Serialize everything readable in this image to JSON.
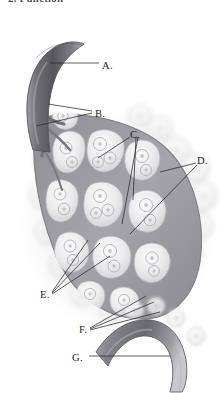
{
  "figure": {
    "title": "2. Function",
    "background_color": "#ffffff",
    "ink_color": "#1d1d1d",
    "width": 223,
    "height": 393,
    "style": "grayscale-pencil-shaded-anatomical-drawing"
  },
  "palette": {
    "duct_dark": "#5d5d60",
    "duct_mid": "#8a8a8e",
    "duct_light": "#b9b9bd",
    "septum": "#9a9a9f",
    "lobule_fill": "#e2e2e4",
    "lobule_inner": "#f2f2f3",
    "cell_outline": "#a9a9ae",
    "halo": "#efeff0",
    "leader_line": "#2a2a2a",
    "text": "#1d1d1d"
  },
  "labels": [
    {
      "id": "A",
      "text": "A.",
      "x": 102,
      "y": 60,
      "leaders": [
        {
          "x1": 99,
          "y1": 63,
          "x2": 50,
          "y2": 63
        }
      ]
    },
    {
      "id": "B",
      "text": "B.",
      "x": 95,
      "y": 108,
      "leaders": [
        {
          "x1": 92,
          "y1": 111,
          "x2": 48,
          "y2": 104
        },
        {
          "x1": 92,
          "y1": 113,
          "x2": 36,
          "y2": 126
        }
      ]
    },
    {
      "id": "C",
      "text": "C.",
      "x": 130,
      "y": 129,
      "leaders": [
        {
          "x1": 130,
          "y1": 137,
          "x2": 98,
          "y2": 158
        },
        {
          "x1": 136,
          "y1": 137,
          "x2": 133,
          "y2": 200
        },
        {
          "x1": 138,
          "y1": 137,
          "x2": 122,
          "y2": 224
        }
      ]
    },
    {
      "id": "D",
      "text": "D.",
      "x": 197,
      "y": 155,
      "leaders": [
        {
          "x1": 196,
          "y1": 163,
          "x2": 160,
          "y2": 172
        },
        {
          "x1": 197,
          "y1": 165,
          "x2": 130,
          "y2": 234
        }
      ]
    },
    {
      "id": "E",
      "text": "E.",
      "x": 40,
      "y": 289,
      "leaders": [
        {
          "x1": 52,
          "y1": 292,
          "x2": 88,
          "y2": 240
        },
        {
          "x1": 52,
          "y1": 293,
          "x2": 100,
          "y2": 243
        },
        {
          "x1": 52,
          "y1": 294,
          "x2": 110,
          "y2": 256
        }
      ]
    },
    {
      "id": "F",
      "text": "F.",
      "x": 79,
      "y": 324,
      "leaders": [
        {
          "x1": 90,
          "y1": 328,
          "x2": 146,
          "y2": 296
        },
        {
          "x1": 90,
          "y1": 329,
          "x2": 154,
          "y2": 302
        },
        {
          "x1": 90,
          "y1": 330,
          "x2": 160,
          "y2": 312
        }
      ]
    },
    {
      "id": "G",
      "text": "G.",
      "x": 72,
      "y": 352,
      "leaders": [
        {
          "x1": 89,
          "y1": 356,
          "x2": 170,
          "y2": 356
        }
      ]
    }
  ]
}
